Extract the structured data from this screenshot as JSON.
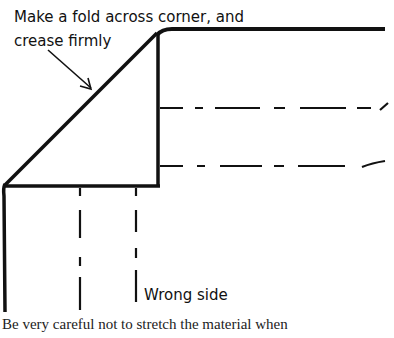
{
  "diagram": {
    "annotation_line1": "Make a fold across corner, and",
    "annotation_line2": "crease firmly",
    "label_wrong_side": "Wrong side",
    "caption": "Be very careful not to stretch the material when",
    "colors": {
      "ink": "#111111",
      "background": "#ffffff",
      "caption_text": "#222222"
    }
  }
}
